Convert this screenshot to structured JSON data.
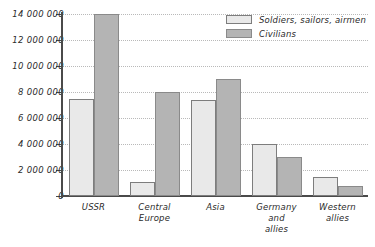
{
  "chart_data": {
    "type": "bar",
    "title": "",
    "xlabel": "",
    "ylabel": "",
    "ylim": [
      0,
      14000000
    ],
    "grid": true,
    "legend_position": "top-right",
    "categories": [
      "USSR",
      "Central\nEurope",
      "Asia",
      "Germany\nand\nallies",
      "Western\nallies"
    ],
    "tick_labels": [
      "0",
      "2 000 000",
      "4 000 000",
      "6 000 000",
      "8 000 000",
      "10 000 000",
      "12 000 000",
      "14 000 000"
    ],
    "tick_values": [
      0,
      2000000,
      4000000,
      6000000,
      8000000,
      10000000,
      12000000,
      14000000
    ],
    "series": [
      {
        "name": "Soldiers, sailors, airmen",
        "color": "#e9e9e9",
        "values": [
          7500000,
          1100000,
          7400000,
          4000000,
          1500000
        ]
      },
      {
        "name": "Civilians",
        "color": "#b4b4b4",
        "values": [
          14000000,
          8000000,
          9000000,
          3000000,
          800000
        ]
      }
    ]
  },
  "legend": {
    "items": [
      {
        "label": "Soldiers, sailors, airmen"
      },
      {
        "label": "Civilians"
      }
    ]
  },
  "categories_display": [
    {
      "lines": [
        "USSR"
      ]
    },
    {
      "lines": [
        "Central",
        "Europe"
      ]
    },
    {
      "lines": [
        "Asia"
      ]
    },
    {
      "lines": [
        "Germany",
        "and",
        "allies"
      ]
    },
    {
      "lines": [
        "Western",
        "allies"
      ]
    }
  ]
}
